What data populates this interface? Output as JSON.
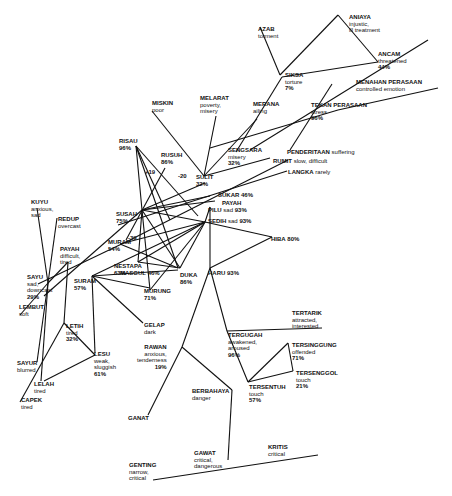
{
  "diagram": {
    "type": "emotion-word-network",
    "nodes": [
      {
        "id": "azab",
        "word": "AZAB",
        "gloss": "torment",
        "pct": "",
        "x": 258,
        "y": 26
      },
      {
        "id": "aniaya",
        "word": "ANIAYA",
        "gloss": "injustic,\nill treatment",
        "pct": "",
        "x": 349,
        "y": 14
      },
      {
        "id": "ancam",
        "word": "ANCAM",
        "gloss": "threatened",
        "pct": "44%",
        "x": 378,
        "y": 51
      },
      {
        "id": "siksa",
        "word": "SIKSA",
        "gloss": "torture",
        "pct": "7%",
        "x": 285,
        "y": 72
      },
      {
        "id": "menahan",
        "word": "MENAHAN PERASAAN",
        "gloss": "controlled emotion",
        "pct": "",
        "x": 356,
        "y": 79
      },
      {
        "id": "tekan",
        "word": "TEKAN PERASAAN",
        "gloss": "stress",
        "pct": "96%",
        "x": 311,
        "y": 102
      },
      {
        "id": "miskin",
        "word": "MISKIN",
        "gloss": "poor",
        "pct": "",
        "x": 152,
        "y": 100
      },
      {
        "id": "melarat",
        "word": "MELARAT",
        "gloss": "poverty,\nmisery",
        "pct": "",
        "x": 200,
        "y": 95
      },
      {
        "id": "merana",
        "word": "MERANA",
        "gloss": "ailing",
        "pct": "",
        "x": 253,
        "y": 101
      },
      {
        "id": "sengsara",
        "word": "SENGSARA",
        "gloss": "misery",
        "pct": "32%",
        "x": 228,
        "y": 147
      },
      {
        "id": "penderitaan",
        "word": "PENDERITAAN",
        "gloss": "suffering",
        "pct": "",
        "x": 287,
        "y": 149,
        "inline": true
      },
      {
        "id": "rumit",
        "word": "RUMIT",
        "gloss": "slow, difficult",
        "pct": "",
        "x": 273,
        "y": 158,
        "inline": true
      },
      {
        "id": "langka",
        "word": "LANGKA",
        "gloss": "rarely",
        "pct": "",
        "x": 288,
        "y": 169,
        "inline": true
      },
      {
        "id": "risau",
        "word": "RISAU",
        "gloss": "",
        "pct": "96%",
        "x": 119,
        "y": 138
      },
      {
        "id": "rusuh",
        "word": "RUSUH",
        "gloss": "",
        "pct": "86%",
        "x": 161,
        "y": 152
      },
      {
        "id": "sulit",
        "word": "SULIT",
        "gloss": "",
        "pct": "32%",
        "x": 196,
        "y": 174
      },
      {
        "id": "sukar",
        "word": "SUKAR",
        "gloss": "",
        "pct": "46%",
        "x": 218,
        "y": 192,
        "inline": true
      },
      {
        "id": "payah_r",
        "word": "PAYAH",
        "gloss": "",
        "pct": "",
        "x": 222,
        "y": 200,
        "inline": true
      },
      {
        "id": "pilu",
        "word": "PILU",
        "gloss": "sad",
        "pct": "93%",
        "x": 208,
        "y": 207,
        "inline": true
      },
      {
        "id": "sedih",
        "word": "SEDIH",
        "gloss": "sad",
        "pct": "93%",
        "x": 208,
        "y": 218,
        "inline": true
      },
      {
        "id": "hiba",
        "word": "HIBA",
        "gloss": "",
        "pct": "80%",
        "x": 271,
        "y": 236,
        "inline": true
      },
      {
        "id": "susah",
        "word": "SUSAH",
        "gloss": "",
        "pct": "75%",
        "x": 116,
        "y": 211
      },
      {
        "id": "kuyu",
        "word": "KUYU",
        "gloss": "anxious,\nsad",
        "pct": "",
        "x": 31,
        "y": 199
      },
      {
        "id": "redup",
        "word": "REDUP",
        "gloss": "overcast",
        "pct": "",
        "x": 58,
        "y": 216
      },
      {
        "id": "payah_l",
        "word": "PAYAH",
        "gloss": "difficult,\ntired",
        "pct": "",
        "x": 60,
        "y": 246
      },
      {
        "id": "muram",
        "word": "MURAM",
        "gloss": "",
        "pct": "54%",
        "x": 108,
        "y": 239
      },
      {
        "id": "nestapa",
        "word": "NESTAPA",
        "gloss": "",
        "pct": "63%",
        "x": 114,
        "y": 263
      },
      {
        "id": "masgul",
        "word": "MASGUL",
        "gloss": "",
        "pct": "46%",
        "x": 120,
        "y": 270,
        "inline": true
      },
      {
        "id": "duka",
        "word": "DUKA",
        "gloss": "",
        "pct": "86%",
        "x": 180,
        "y": 272
      },
      {
        "id": "haru",
        "word": "HARU",
        "gloss": "",
        "pct": "93%",
        "x": 208,
        "y": 270,
        "inline": true
      },
      {
        "id": "murung",
        "word": "MURUNG",
        "gloss": "",
        "pct": "71%",
        "x": 144,
        "y": 288
      },
      {
        "id": "sayu",
        "word": "SAYU",
        "gloss": "sad,\ndowncast",
        "pct": "29%",
        "x": 27,
        "y": 274
      },
      {
        "id": "suram",
        "word": "SURAM",
        "gloss": "",
        "pct": "57%",
        "x": 74,
        "y": 278
      },
      {
        "id": "lembut",
        "word": "LEMBUT",
        "gloss": "soft",
        "pct": "",
        "x": 19,
        "y": 304
      },
      {
        "id": "letih",
        "word": "LETIH",
        "gloss": "tired",
        "pct": "32%",
        "x": 66,
        "y": 323
      },
      {
        "id": "lesu",
        "word": "LESU",
        "gloss": "weak,\nsluggish",
        "pct": "61%",
        "x": 94,
        "y": 351
      },
      {
        "id": "sayur",
        "word": "SAYUR",
        "gloss": "blurred",
        "pct": "",
        "x": 17,
        "y": 360
      },
      {
        "id": "lelah",
        "word": "LELAH",
        "gloss": "tired",
        "pct": "",
        "x": 34,
        "y": 381
      },
      {
        "id": "capek",
        "word": "CAPEK",
        "gloss": "tired",
        "pct": "",
        "x": 21,
        "y": 397
      },
      {
        "id": "gelap",
        "word": "GELAP",
        "gloss": "dark",
        "pct": "",
        "x": 144,
        "y": 322
      },
      {
        "id": "rawan",
        "word": "RAWAN",
        "gloss": "anxious,\ntenderness",
        "pct": "19%",
        "x": 137,
        "y": 344,
        "right": true
      },
      {
        "id": "ganat",
        "word": "GANAT",
        "gloss": "",
        "pct": "",
        "x": 128,
        "y": 415
      },
      {
        "id": "berbahaya",
        "word": "BERBAHAYA",
        "gloss": "danger",
        "pct": "",
        "x": 192,
        "y": 388
      },
      {
        "id": "tergugah",
        "word": "TERGUGAH",
        "gloss": "awakened,\naroused",
        "pct": "96%",
        "x": 228,
        "y": 332
      },
      {
        "id": "tertarik",
        "word": "TERTARIK",
        "gloss": "attracted,\ninterested",
        "pct": "",
        "x": 292,
        "y": 310
      },
      {
        "id": "tersinggung",
        "word": "TERSINGGUNG",
        "gloss": "offended",
        "pct": "71%",
        "x": 292,
        "y": 342
      },
      {
        "id": "tersenggol",
        "word": "TERSENGGOL",
        "gloss": "touch",
        "pct": "21%",
        "x": 296,
        "y": 370
      },
      {
        "id": "tersentuh",
        "word": "TERSENTUH",
        "gloss": "touch",
        "pct": "57%",
        "x": 249,
        "y": 384
      },
      {
        "id": "genting",
        "word": "GENTING",
        "gloss": "narrow,\ncritical",
        "pct": "",
        "x": 129,
        "y": 462
      },
      {
        "id": "gawat",
        "word": "GAWAT",
        "gloss": "critical,\ndangerous",
        "pct": "",
        "x": 194,
        "y": 450
      },
      {
        "id": "kritis",
        "word": "KRITIS",
        "gloss": "critical",
        "pct": "",
        "x": 268,
        "y": 444
      }
    ],
    "edge_labels": [
      {
        "text": "+19",
        "x": 145,
        "y": 169
      },
      {
        "text": "-20",
        "x": 178,
        "y": 173
      },
      {
        "text": "-39",
        "x": 128,
        "y": 235
      }
    ],
    "edges": [
      [
        260,
        27,
        280,
        75
      ],
      [
        280,
        75,
        338,
        15
      ],
      [
        338,
        15,
        378,
        62
      ],
      [
        378,
        62,
        282,
        77
      ],
      [
        282,
        77,
        236,
        152
      ],
      [
        210,
        148,
        338,
        110
      ],
      [
        338,
        110,
        438,
        88
      ],
      [
        290,
        150,
        332,
        84
      ],
      [
        250,
        150,
        428,
        40
      ],
      [
        204,
        176,
        152,
        111
      ],
      [
        204,
        176,
        216,
        116
      ],
      [
        204,
        176,
        257,
        119
      ],
      [
        204,
        176,
        270,
        158
      ],
      [
        130,
        240,
        288,
        160
      ],
      [
        118,
        225,
        287,
        171
      ],
      [
        136,
        146,
        170,
        220
      ],
      [
        136,
        146,
        198,
        216
      ],
      [
        136,
        146,
        178,
        268
      ],
      [
        136,
        146,
        142,
        210
      ],
      [
        165,
        168,
        126,
        240
      ],
      [
        142,
        210,
        205,
        183
      ],
      [
        142,
        210,
        210,
        196
      ],
      [
        142,
        210,
        215,
        201
      ],
      [
        142,
        210,
        205,
        222
      ],
      [
        205,
        222,
        210,
        207
      ],
      [
        210,
        207,
        210,
        268
      ],
      [
        205,
        222,
        272,
        237
      ],
      [
        272,
        237,
        210,
        268
      ],
      [
        142,
        210,
        150,
        290
      ],
      [
        142,
        210,
        180,
        268
      ],
      [
        142,
        210,
        138,
        262
      ],
      [
        205,
        222,
        150,
        290
      ],
      [
        205,
        222,
        180,
        268
      ],
      [
        205,
        222,
        138,
        262
      ],
      [
        205,
        222,
        92,
        276
      ],
      [
        205,
        222,
        120,
        244
      ],
      [
        142,
        210,
        44,
        296
      ],
      [
        120,
        244,
        178,
        268
      ],
      [
        138,
        262,
        180,
        268
      ],
      [
        92,
        276,
        150,
        288
      ],
      [
        92,
        276,
        178,
        270
      ],
      [
        92,
        276,
        143,
        323
      ],
      [
        130,
        240,
        38,
        284
      ],
      [
        48,
        283,
        37,
        208
      ],
      [
        48,
        283,
        57,
        218
      ],
      [
        48,
        283,
        68,
        262
      ],
      [
        48,
        283,
        20,
        315
      ],
      [
        48,
        283,
        37,
        362
      ],
      [
        48,
        283,
        41,
        381
      ],
      [
        68,
        262,
        64,
        323
      ],
      [
        64,
        323,
        95,
        355
      ],
      [
        95,
        355,
        44,
        381
      ],
      [
        64,
        323,
        20,
        402
      ],
      [
        92,
        276,
        95,
        353
      ],
      [
        210,
        268,
        182,
        347
      ],
      [
        210,
        268,
        227,
        331
      ],
      [
        182,
        347,
        148,
        415
      ],
      [
        182,
        347,
        232,
        390
      ],
      [
        232,
        390,
        228,
        460
      ],
      [
        227,
        331,
        248,
        382
      ],
      [
        248,
        382,
        288,
        343
      ],
      [
        288,
        343,
        293,
        371
      ],
      [
        293,
        371,
        248,
        382
      ],
      [
        227,
        331,
        322,
        328
      ],
      [
        153,
        480,
        318,
        455
      ]
    ]
  }
}
